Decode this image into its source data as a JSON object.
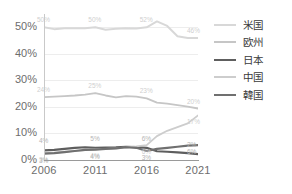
{
  "chart_data": {
    "type": "line",
    "title": "",
    "xlabel": "",
    "ylabel": "",
    "x": [
      2006,
      2011,
      2016,
      2021
    ],
    "tick_labels_x": [
      "2006",
      "2011",
      "2016",
      "2021"
    ],
    "tick_labels_y": [
      "0%",
      "10%",
      "20%",
      "30%",
      "40%",
      "50%"
    ],
    "ylim": [
      0,
      55
    ],
    "xlim": [
      2006,
      2021
    ],
    "grid": true,
    "legend_position": "right",
    "series": [
      {
        "name": "米国",
        "color": "#d8d8d8",
        "width": 2.0,
        "values": [
          50,
          50,
          50,
          46
        ],
        "points": [
          {
            "x": 2006,
            "y": 50
          },
          {
            "x": 2007,
            "y": 49.3
          },
          {
            "x": 2008,
            "y": 49.6
          },
          {
            "x": 2009,
            "y": 49.6
          },
          {
            "x": 2010,
            "y": 49.6
          },
          {
            "x": 2011,
            "y": 50
          },
          {
            "x": 2012,
            "y": 49.1
          },
          {
            "x": 2013,
            "y": 49.4
          },
          {
            "x": 2014,
            "y": 49.6
          },
          {
            "x": 2015,
            "y": 49.5
          },
          {
            "x": 2016,
            "y": 50
          },
          {
            "x": 2017,
            "y": 52.2
          },
          {
            "x": 2018,
            "y": 50.5
          },
          {
            "x": 2019,
            "y": 46.6
          },
          {
            "x": 2020,
            "y": 46.0
          },
          {
            "x": 2021,
            "y": 46
          }
        ],
        "labels": [
          {
            "x": 2006,
            "y": 50,
            "text": "50%"
          },
          {
            "x": 2011,
            "y": 50,
            "text": "50%"
          },
          {
            "x": 2016,
            "y": 50,
            "text": "52%"
          },
          {
            "x": 2021,
            "y": 46,
            "text": "46%"
          }
        ]
      },
      {
        "name": "欧州",
        "color": "#c6c6c6",
        "width": 1.8,
        "values": [
          24,
          25,
          23,
          20
        ],
        "points": [
          {
            "x": 2006,
            "y": 23.7
          },
          {
            "x": 2007,
            "y": 23.9
          },
          {
            "x": 2008,
            "y": 24.1
          },
          {
            "x": 2009,
            "y": 24.3
          },
          {
            "x": 2010,
            "y": 24.6
          },
          {
            "x": 2011,
            "y": 25.2
          },
          {
            "x": 2012,
            "y": 24.3
          },
          {
            "x": 2013,
            "y": 23.6
          },
          {
            "x": 2014,
            "y": 24.1
          },
          {
            "x": 2015,
            "y": 23.9
          },
          {
            "x": 2016,
            "y": 23.2
          },
          {
            "x": 2017,
            "y": 21.6
          },
          {
            "x": 2018,
            "y": 21.2
          },
          {
            "x": 2019,
            "y": 20.7
          },
          {
            "x": 2020,
            "y": 20.1
          },
          {
            "x": 2021,
            "y": 19.4
          }
        ],
        "labels": [
          {
            "x": 2006,
            "y": 23.7,
            "text": "24%"
          },
          {
            "x": 2011,
            "y": 25.2,
            "text": "25%"
          },
          {
            "x": 2016,
            "y": 23.2,
            "text": "23%"
          },
          {
            "x": 2021,
            "y": 19.4,
            "text": "20%"
          }
        ]
      },
      {
        "name": "日本",
        "color": "#5e5e5e",
        "width": 2.2,
        "values": [
          4,
          5,
          6,
          2
        ],
        "points": [
          {
            "x": 2006,
            "y": 3.6
          },
          {
            "x": 2007,
            "y": 3.8
          },
          {
            "x": 2008,
            "y": 4.2
          },
          {
            "x": 2009,
            "y": 4.6
          },
          {
            "x": 2010,
            "y": 4.8
          },
          {
            "x": 2011,
            "y": 4.6
          },
          {
            "x": 2012,
            "y": 4.7
          },
          {
            "x": 2013,
            "y": 4.8
          },
          {
            "x": 2014,
            "y": 5.0
          },
          {
            "x": 2015,
            "y": 4.9
          },
          {
            "x": 2016,
            "y": 4.6
          },
          {
            "x": 2017,
            "y": 3.3
          },
          {
            "x": 2018,
            "y": 3.1
          },
          {
            "x": 2019,
            "y": 2.9
          },
          {
            "x": 2020,
            "y": 2.6
          },
          {
            "x": 2021,
            "y": 2.2
          }
        ],
        "labels": [
          {
            "x": 2006,
            "y": 3.6,
            "text": "4%"
          },
          {
            "x": 2011,
            "y": 4.6,
            "text": "5%"
          },
          {
            "x": 2016,
            "y": 4.6,
            "text": "6%"
          },
          {
            "x": 2021,
            "y": 2.2,
            "text": "2%"
          }
        ]
      },
      {
        "name": "中国",
        "color": "#cdcdcd",
        "width": 1.8,
        "values": [
          3,
          4,
          6,
          17
        ],
        "points": [
          {
            "x": 2006,
            "y": 2.6
          },
          {
            "x": 2007,
            "y": 2.8
          },
          {
            "x": 2008,
            "y": 3.1
          },
          {
            "x": 2009,
            "y": 3.4
          },
          {
            "x": 2010,
            "y": 3.7
          },
          {
            "x": 2011,
            "y": 4.0
          },
          {
            "x": 2012,
            "y": 4.2
          },
          {
            "x": 2013,
            "y": 4.4
          },
          {
            "x": 2014,
            "y": 4.7
          },
          {
            "x": 2015,
            "y": 5.1
          },
          {
            "x": 2016,
            "y": 5.6
          },
          {
            "x": 2017,
            "y": 9.0
          },
          {
            "x": 2018,
            "y": 11.0
          },
          {
            "x": 2019,
            "y": 12.4
          },
          {
            "x": 2020,
            "y": 13.8
          },
          {
            "x": 2021,
            "y": 16.8
          }
        ],
        "labels": [
          {
            "x": 2006,
            "y": 2.6,
            "text": "3%"
          },
          {
            "x": 2011,
            "y": 4.0,
            "text": "4%"
          },
          {
            "x": 2016,
            "y": 5.6,
            "text": "6%"
          },
          {
            "x": 2021,
            "y": 16.8,
            "text": "17%"
          }
        ]
      },
      {
        "name": "韓国",
        "color": "#707070",
        "width": 2.2,
        "values": [
          3,
          4,
          3,
          6
        ],
        "points": [
          {
            "x": 2006,
            "y": 2.4
          },
          {
            "x": 2007,
            "y": 2.6
          },
          {
            "x": 2008,
            "y": 3.0
          },
          {
            "x": 2009,
            "y": 3.4
          },
          {
            "x": 2010,
            "y": 3.8
          },
          {
            "x": 2011,
            "y": 3.9
          },
          {
            "x": 2012,
            "y": 4.2
          },
          {
            "x": 2013,
            "y": 4.4
          },
          {
            "x": 2014,
            "y": 4.8
          },
          {
            "x": 2015,
            "y": 4.6
          },
          {
            "x": 2016,
            "y": 3.4
          },
          {
            "x": 2017,
            "y": 4.2
          },
          {
            "x": 2018,
            "y": 4.6
          },
          {
            "x": 2019,
            "y": 5.0
          },
          {
            "x": 2020,
            "y": 5.4
          },
          {
            "x": 2021,
            "y": 5.6
          }
        ],
        "labels": [
          {
            "x": 2006,
            "y": 2.4,
            "text": "3%"
          },
          {
            "x": 2011,
            "y": 3.9,
            "text": "4%"
          },
          {
            "x": 2016,
            "y": 3.4,
            "text": "3%"
          },
          {
            "x": 2021,
            "y": 5.6,
            "text": "6%"
          }
        ]
      }
    ]
  },
  "legend": {
    "items": [
      {
        "label": "米国"
      },
      {
        "label": "欧州"
      },
      {
        "label": "日本"
      },
      {
        "label": "中国"
      },
      {
        "label": "韓国"
      }
    ]
  },
  "caption": {
    "text": ""
  }
}
